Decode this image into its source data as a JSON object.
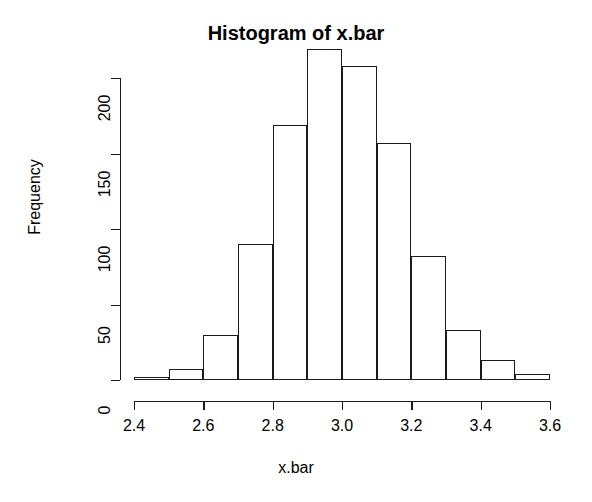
{
  "chart_data": {
    "type": "bar",
    "title": "Histogram of x.bar",
    "xlabel": "x.bar",
    "ylabel": "Frequency",
    "bin_width": 0.1,
    "bin_edges": [
      2.4,
      2.5,
      2.6,
      2.7,
      2.8,
      2.9,
      3.0,
      3.1,
      3.2,
      3.3,
      3.4,
      3.5,
      3.6
    ],
    "categories": [
      "2.4-2.5",
      "2.5-2.6",
      "2.6-2.7",
      "2.7-2.8",
      "2.8-2.9",
      "2.9-3.0",
      "3.0-3.1",
      "3.1-3.2",
      "3.2-3.3",
      "3.3-3.4",
      "3.4-3.5",
      "3.5-3.6"
    ],
    "values": [
      2,
      7,
      30,
      90,
      169,
      219,
      208,
      157,
      82,
      33,
      13,
      4
    ],
    "xlim": [
      2.4,
      3.6
    ],
    "ylim": [
      0,
      220
    ],
    "xticks": [
      2.4,
      2.6,
      2.8,
      3.0,
      3.2,
      3.4,
      3.6
    ],
    "xtick_labels": [
      "2.4",
      "2.6",
      "2.8",
      "3.0",
      "3.2",
      "3.4",
      "3.6"
    ],
    "yticks": [
      0,
      50,
      100,
      150,
      200
    ],
    "ytick_labels": [
      "0",
      "50",
      "100",
      "150",
      "200"
    ],
    "grid": false,
    "legend": null,
    "bar_fill_color": "#ffffff",
    "bar_border_color": "#1a1a1a",
    "background_color": "#ffffff"
  }
}
